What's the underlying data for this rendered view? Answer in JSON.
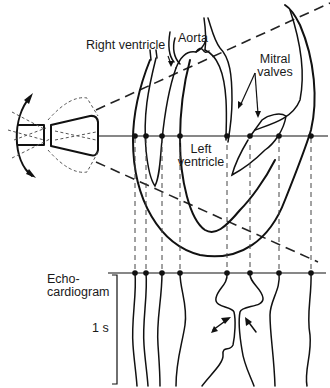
{
  "labels": {
    "right_ventricle": "Right ventricle",
    "aorta": "Aorta",
    "mitral_valves_line1": "Mitral",
    "mitral_valves_line2": "valves",
    "left_ventricle_line1": "Left",
    "left_ventricle_line2": "ventricle",
    "echo_line1": "Echo-",
    "echo_line2": "cardiogram",
    "time_scale": "1 s"
  },
  "geometry": {
    "beam_line_y": 136,
    "echo_line_y": 273,
    "interface_x": [
      135,
      146,
      162,
      180,
      227,
      250,
      279,
      311
    ]
  },
  "colors": {
    "ink": "#111111",
    "background": "#ffffff"
  }
}
